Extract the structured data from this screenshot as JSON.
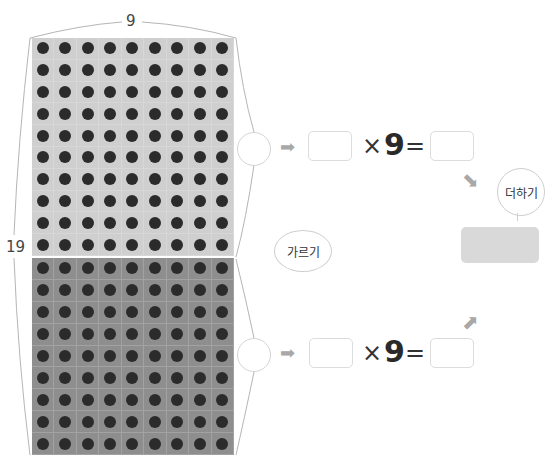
{
  "diagram": {
    "top_label": "9",
    "side_label": "19",
    "columns": 9,
    "top_rows": 10,
    "bottom_rows": 9,
    "colors": {
      "top_fill": "#cfcfcf",
      "bottom_fill": "#8e8e8e",
      "dot": "#2b2b2b",
      "result_fill": "#d9d9d9"
    }
  },
  "equations": [
    {
      "left_blank": "",
      "times": "×",
      "multiplier": "9",
      "equals": "=",
      "right_blank": ""
    },
    {
      "left_blank": "",
      "times": "×",
      "multiplier": "9",
      "equals": "=",
      "right_blank": ""
    }
  ],
  "bubbles": {
    "split": "가르기",
    "add": "더하기"
  },
  "icons": {
    "right_arrow": "➡",
    "down_right_arrow": "⬊",
    "up_right_arrow": "⬈"
  }
}
